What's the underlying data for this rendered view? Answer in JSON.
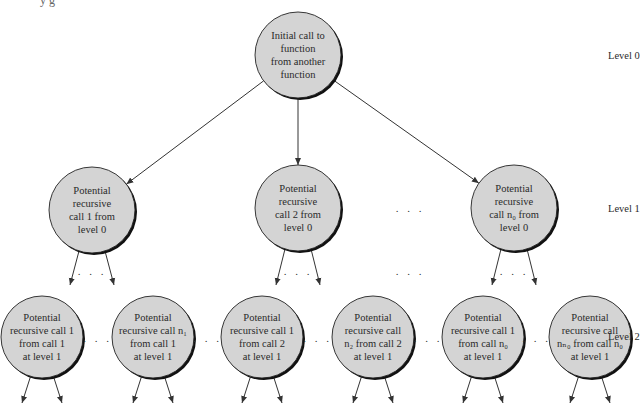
{
  "header_fragment": "y    g",
  "colors": {
    "node_fill": "#d4d4d4",
    "node_stroke": "#222222",
    "edge": "#333333",
    "text": "#2a2a2a"
  },
  "levels": [
    {
      "label": "Level 0"
    },
    {
      "label": "Level 1"
    },
    {
      "label": "Level 2"
    }
  ],
  "nodes": {
    "root": {
      "lines": [
        "Initial call to",
        "function",
        "from another",
        "function"
      ]
    },
    "level1": [
      {
        "lines": [
          "Potential",
          "recursive",
          "call 1 from",
          "level 0"
        ]
      },
      {
        "lines": [
          "Potential",
          "recursive",
          "call 2 from",
          "level 0"
        ]
      },
      {
        "lines": [
          "Potential",
          "recursive",
          "call n₀ from",
          "level 0"
        ]
      }
    ],
    "level2": [
      {
        "lines": [
          "Potential",
          "recursive call 1",
          "from call 1",
          "at level 1"
        ]
      },
      {
        "lines": [
          "Potential",
          "recursive call n₁",
          "from call 1",
          "at level 1"
        ]
      },
      {
        "lines": [
          "Potential",
          "recursive call 1",
          "from call 2",
          "at level 1"
        ]
      },
      {
        "lines": [
          "Potential",
          "recursive call",
          "n₂ from call 2",
          "at level 1"
        ]
      },
      {
        "lines": [
          "Potential",
          "recursive call 1",
          "from call n₀",
          "at level 1"
        ]
      },
      {
        "lines": [
          "Potential",
          "recursive call",
          "nₙ₀ from call n₀",
          "at level 1"
        ]
      }
    ]
  },
  "ellipsis": ". . ."
}
